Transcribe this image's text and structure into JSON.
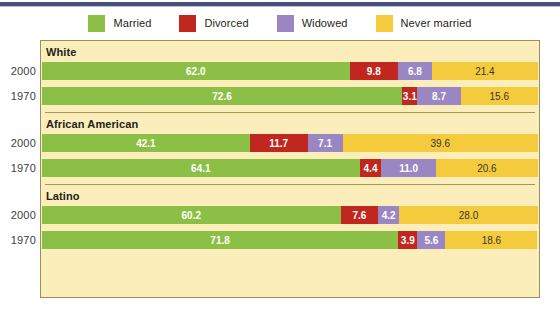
{
  "legend": {
    "items": [
      {
        "label": "Married",
        "color": "#8cbf45",
        "icon": "legend-swatch"
      },
      {
        "label": "Divorced",
        "color": "#c0271e",
        "icon": "legend-swatch"
      },
      {
        "label": "Widowed",
        "color": "#9b86c4",
        "icon": "legend-swatch"
      },
      {
        "label": "Never married",
        "color": "#f5cb3e",
        "icon": "legend-swatch"
      }
    ]
  },
  "panel": {
    "background": "#fbeeba",
    "border_color": "#9a8f62",
    "divider_color": "#a7964f"
  },
  "chart_data": {
    "type": "bar",
    "title": "",
    "subtitle": "",
    "orientation": "horizontal",
    "stacked": true,
    "stack_total": 100,
    "xlabel": "",
    "ylabel": "",
    "xlim": [
      0,
      100
    ],
    "grid": false,
    "legend_position": "top-center",
    "series": [
      {
        "name": "Married",
        "color": "#8cbf45"
      },
      {
        "name": "Divorced",
        "color": "#c0271e"
      },
      {
        "name": "Widowed",
        "color": "#9b86c4"
      },
      {
        "name": "Never married",
        "color": "#f5cb3e"
      }
    ],
    "groups": [
      {
        "label": "White",
        "rows": [
          {
            "year": "2000",
            "values": [
              62.0,
              9.8,
              6.8,
              21.4
            ]
          },
          {
            "year": "1970",
            "values": [
              72.6,
              3.1,
              8.7,
              15.6
            ]
          }
        ]
      },
      {
        "label": "African American",
        "rows": [
          {
            "year": "2000",
            "values": [
              42.1,
              11.7,
              7.1,
              39.6
            ]
          },
          {
            "year": "1970",
            "values": [
              64.1,
              4.4,
              11.0,
              20.6
            ]
          }
        ]
      },
      {
        "label": "Latino",
        "rows": [
          {
            "year": "2000",
            "values": [
              60.2,
              7.6,
              4.2,
              28.0
            ]
          },
          {
            "year": "1970",
            "values": [
              71.8,
              3.9,
              5.6,
              18.6
            ]
          }
        ]
      }
    ]
  }
}
